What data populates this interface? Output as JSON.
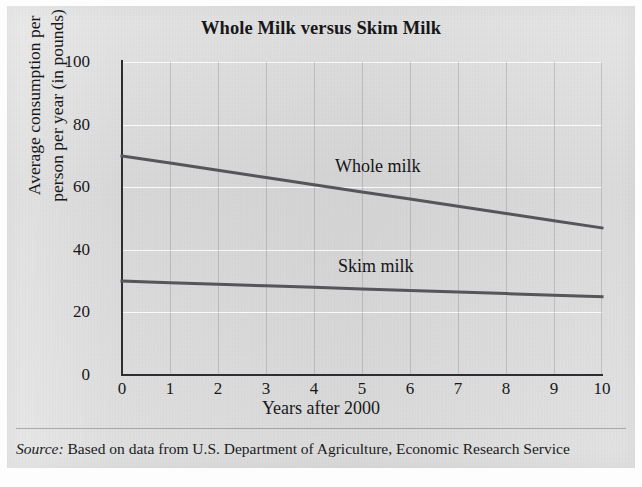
{
  "figure": {
    "title": "Whole Milk versus Skim Milk",
    "source_prefix": "Source:",
    "source_text": "Based on data from U.S. Department of Agriculture, Economic Research Service"
  },
  "colors": {
    "panel_background": "#dcdcdc",
    "axis": "#2e2e32",
    "series_line": "#55555a",
    "vertical_gridline": "#787880",
    "horizontal_gridline": "#ffffff",
    "text": "#18181b"
  },
  "chart_data": {
    "type": "line",
    "title": "Whole Milk versus Skim Milk",
    "xlabel": "Years after 2000",
    "ylabel_line1": "Average consumption per",
    "ylabel_line2": "person per year (in pounds)",
    "ylabel": "Average consumption per person per year (in pounds)",
    "x": [
      0,
      1,
      2,
      3,
      4,
      5,
      6,
      7,
      8,
      9,
      10
    ],
    "xticks": [
      "0",
      "1",
      "2",
      "3",
      "4",
      "5",
      "6",
      "7",
      "8",
      "9",
      "10"
    ],
    "yticks": [
      "0",
      "20",
      "40",
      "60",
      "80",
      "100"
    ],
    "ytick_values": [
      0,
      20,
      40,
      60,
      80,
      100
    ],
    "xlim": [
      0,
      10
    ],
    "ylim": [
      0,
      100
    ],
    "grid": true,
    "legend": "in-plot annotations",
    "series": [
      {
        "name": "Whole milk",
        "label": "Whole milk",
        "values": [
          70.0,
          67.7,
          65.4,
          63.1,
          60.8,
          58.5,
          56.2,
          53.9,
          51.6,
          49.3,
          47.0
        ],
        "endpoints": [
          70,
          47
        ]
      },
      {
        "name": "Skim milk",
        "label": "Skim milk",
        "values": [
          30.0,
          29.5,
          29.0,
          28.5,
          28.0,
          27.5,
          27.0,
          26.5,
          26.0,
          25.5,
          25.0
        ],
        "endpoints": [
          30,
          25
        ]
      }
    ]
  }
}
